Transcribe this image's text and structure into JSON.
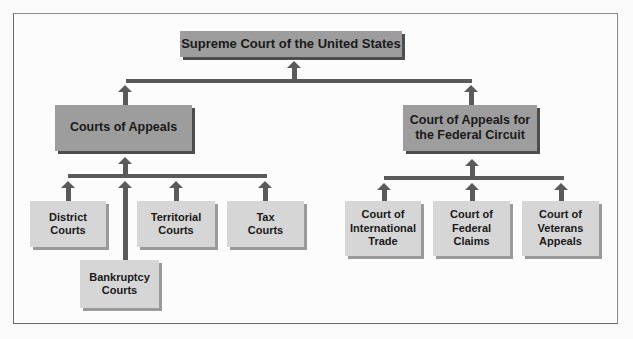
{
  "diagram": {
    "nodes": {
      "supreme": "Supreme Court of the United States",
      "appeals": "Courts of Appeals",
      "federal_circuit": "Court of Appeals for\nthe Federal Circuit",
      "district": "District\nCourts",
      "bankruptcy": "Bankruptcy\nCourts",
      "territorial": "Territorial\nCourts",
      "tax": "Tax\nCourts",
      "international_trade": "Court of\nInternational\nTrade",
      "federal_claims": "Court of\nFederal\nClaims",
      "veterans_appeals": "Court of\nVeterans\nAppeals"
    },
    "edges": [
      {
        "from": "appeals",
        "to": "supreme"
      },
      {
        "from": "federal_circuit",
        "to": "supreme"
      },
      {
        "from": "district",
        "to": "appeals"
      },
      {
        "from": "bankruptcy",
        "to": "appeals"
      },
      {
        "from": "territorial",
        "to": "appeals"
      },
      {
        "from": "tax",
        "to": "appeals"
      },
      {
        "from": "international_trade",
        "to": "federal_circuit"
      },
      {
        "from": "federal_claims",
        "to": "federal_circuit"
      },
      {
        "from": "veterans_appeals",
        "to": "federal_circuit"
      }
    ],
    "colors": {
      "top_box": "#9d9d9d",
      "bottom_box": "#d6d6d6",
      "connector": "#5a5a5a",
      "shadow": "#4d4d4d"
    }
  }
}
